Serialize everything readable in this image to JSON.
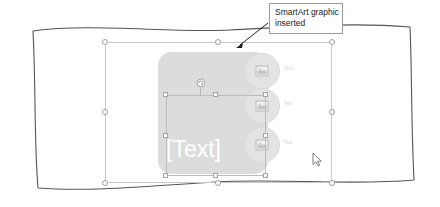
{
  "canvas": {
    "width": 440,
    "height": 207,
    "background": "#ffffff"
  },
  "callout": {
    "line1": "SmartArt graphic",
    "line2": "inserted",
    "border_color": "#9a9a9a",
    "text_color": "#1a1a1a"
  },
  "page": {
    "name": "document-page",
    "border_color": "#555555",
    "fill": "#ffffff"
  },
  "smartart": {
    "name": "smartart-graphic",
    "body_label": "[Text]",
    "body_fill": "#dcdcdc",
    "body_text_color": "#ffffff",
    "circles": [
      {
        "label": "Text",
        "icon": "picture-icon"
      },
      {
        "label": "Text",
        "icon": "picture-icon"
      },
      {
        "label": "Text",
        "icon": "picture-icon"
      }
    ],
    "circle_fill": "#e3e3e3",
    "label_color": "#cfcfcf"
  },
  "selection": {
    "outer_frame_name": "smartart-selection-frame",
    "inner_frame_name": "shape-selection-frame",
    "handle_fill": "#ffffff",
    "handle_border": "#9d9d9d",
    "rotate_handle": "rotate-handle"
  },
  "cursor": {
    "name": "mouse-pointer",
    "type": "arrow"
  }
}
